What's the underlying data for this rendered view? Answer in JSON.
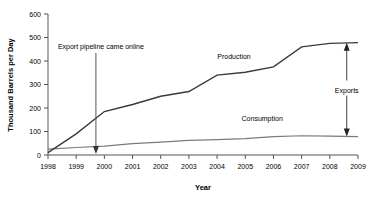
{
  "chart_data": {
    "type": "line",
    "title": "",
    "xlabel": "Year",
    "ylabel": "Thousand Barrels per Day",
    "xlim": [
      1998,
      2009
    ],
    "ylim": [
      0,
      600
    ],
    "ytick_labels": [
      "0",
      "100",
      "200",
      "300",
      "400",
      "500",
      "600"
    ],
    "ytick_values": [
      0,
      100,
      200,
      300,
      400,
      500,
      600
    ],
    "xtick_labels": [
      "1998",
      "1999",
      "2000",
      "2001",
      "2002",
      "2003",
      "2004",
      "2005",
      "2006",
      "2007",
      "2008",
      "2009"
    ],
    "xtick_values": [
      1998,
      1999,
      2000,
      2001,
      2002,
      2003,
      2004,
      2005,
      2006,
      2007,
      2008,
      2009
    ],
    "grid": false,
    "legend": "inline-labels",
    "x": [
      1998,
      1999,
      2000,
      2001,
      2002,
      2003,
      2004,
      2005,
      2006,
      2007,
      2008,
      2009
    ],
    "series": [
      {
        "name": "Production",
        "color": "#3a3a3a",
        "values": [
          10,
          90,
          185,
          215,
          250,
          270,
          340,
          352,
          375,
          460,
          475,
          478
        ]
      },
      {
        "name": "Consumption",
        "color": "#7a7a7a",
        "values": [
          25,
          32,
          38,
          48,
          55,
          62,
          65,
          70,
          78,
          82,
          80,
          78
        ]
      }
    ],
    "annotations": [
      {
        "id": "pipeline",
        "text": "Export pipeline came online",
        "x": 1999.7,
        "arrow": "down"
      },
      {
        "id": "exports",
        "text": "Exports",
        "x": 2008.6,
        "arrow": "double-vertical"
      }
    ],
    "series_labels": [
      {
        "id": "production-label",
        "text": "Production",
        "x": 2004.6,
        "y": 410
      },
      {
        "id": "consumption-label",
        "text": "Consumption",
        "x": 2005.6,
        "y": 145
      }
    ]
  }
}
